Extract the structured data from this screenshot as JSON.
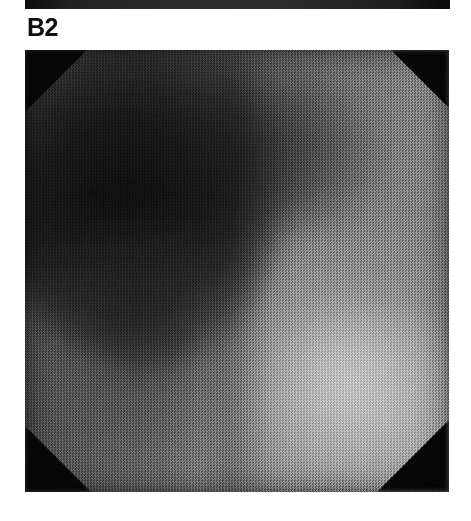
{
  "figure": {
    "panel_label": "B2",
    "label_color": "#101010",
    "background_color": "#ffffff"
  },
  "panel_above": {
    "description": "bottom-edge-sliver-of-preceding-panel",
    "color": "#272727"
  },
  "scan": {
    "alt_text": "B2",
    "modality": "grayscale-scan",
    "corner_mask_color": "#070707",
    "dark_region_color": "#141414",
    "mid_region_color": "#6e6e6e",
    "bright_region_color": "#a9a9a9",
    "regions": [
      {
        "name": "dark-mass-upper-left",
        "tone": "#151515"
      },
      {
        "name": "dark-band-upper",
        "tone": "#232323"
      },
      {
        "name": "mid-field-center",
        "tone": "#5e5e5e"
      },
      {
        "name": "bright-lobe-lower-right",
        "tone": "#b4b4b4"
      },
      {
        "name": "corner-aperture-mask",
        "tone": "#070707"
      }
    ]
  },
  "ghost_caption": {
    "text": "",
    "visible": "faint-scanner-artifact"
  }
}
